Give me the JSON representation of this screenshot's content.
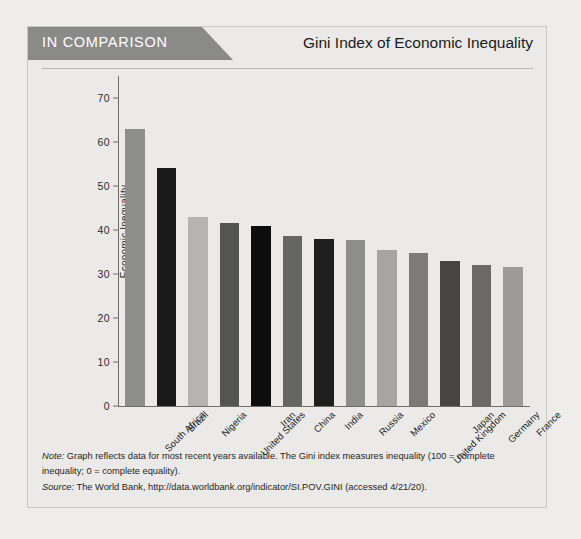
{
  "header": {
    "tab_label": "IN COMPARISON",
    "title": "Gini Index of Economic Inequality"
  },
  "notes": {
    "note_label": "Note:",
    "note_text": " Graph reflects data for most recent years available. The Gini index measures inequality (100 = complete inequality; 0 = complete equality).",
    "source_label": "Source:",
    "source_text": " The World Bank, http://data.worldbank.org/indicator/SI.POV.GINI (accessed 4/21/20)."
  },
  "colors": {
    "tab_background": "#8a8a88",
    "figure_background": "#ebeae8",
    "axis": "#6f6f6d",
    "title_text": "#1c1c1c"
  },
  "chart_data": {
    "type": "bar",
    "title": "Gini Index of Economic Inequality",
    "xlabel": "",
    "ylabel": "Economic Inequality",
    "ylim": [
      0,
      75
    ],
    "yticks": [
      0,
      10,
      20,
      30,
      40,
      50,
      60,
      70
    ],
    "grid": false,
    "legend": "none",
    "categories": [
      "South Africa",
      "Brazil",
      "Nigeria",
      "United States",
      "Iran",
      "China",
      "India",
      "Russia",
      "Mexico",
      "United Kingdom",
      "Japan",
      "Germany",
      "France"
    ],
    "values": [
      63,
      54,
      43,
      41.5,
      41,
      38.7,
      38,
      37.7,
      35.5,
      34.8,
      33.0,
      32.0,
      31.6
    ],
    "bar_colors": [
      "#8e8e8c",
      "#1a1a1a",
      "#b5b4b2",
      "#545452",
      "#0d0d0d",
      "#656563",
      "#1f1f1f",
      "#8e8e8c",
      "#a6a5a3",
      "#7b7b79",
      "#454543",
      "#6a6a68",
      "#9c9b99"
    ]
  }
}
